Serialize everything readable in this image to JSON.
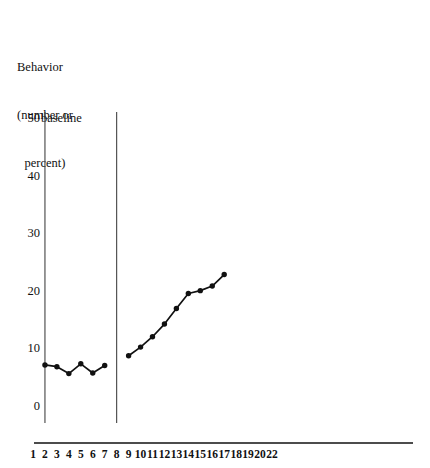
{
  "chart_data": {
    "type": "line",
    "title": "",
    "ylabel_lines": [
      "Behavior",
      "(number or",
      "percent)"
    ],
    "ylabel": "Behavior (number or percent)",
    "xlabel": "",
    "ylim": [
      0,
      50
    ],
    "y_ticks": [
      50,
      40,
      30,
      20,
      10,
      0
    ],
    "x_tick_labels": [
      "1",
      "2",
      "3",
      "4",
      "5",
      "6",
      "7",
      "8",
      "9",
      "10",
      "11",
      "12",
      "13",
      "14",
      "15",
      "16",
      "17",
      "18",
      "19",
      "20",
      "22"
    ],
    "grid": false,
    "legend": "none",
    "annotations": [
      {
        "text": "baseline",
        "x_session": 2,
        "y_value": 50
      }
    ],
    "phase_lines": [
      {
        "name": "baseline-start-line",
        "x_session": 2
      },
      {
        "name": "intervention-start-line",
        "x_session": 8
      }
    ],
    "series": [
      {
        "name": "Baseline",
        "x": [
          2,
          3,
          4,
          5,
          6,
          7
        ],
        "values": [
          7.3,
          7.0,
          5.8,
          7.5,
          5.9,
          7.2
        ]
      },
      {
        "name": "Intervention",
        "x": [
          9,
          10,
          11,
          12,
          13,
          14,
          15,
          16,
          17
        ],
        "values": [
          8.9,
          10.4,
          12.2,
          14.4,
          17.1,
          19.7,
          20.2,
          21.0,
          23.0
        ]
      }
    ],
    "colors": {
      "line": "#111111",
      "marker": "#111111",
      "axis": "#111111",
      "phase_line": "#444444",
      "background": "#ffffff"
    }
  }
}
